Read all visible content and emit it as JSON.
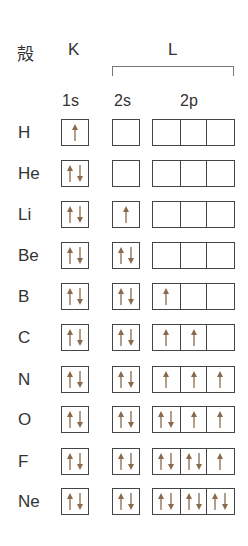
{
  "header": {
    "shell_label": "殻",
    "shell_k": "K",
    "shell_l": "L",
    "orbital_1s": "1s",
    "orbital_2s": "2s",
    "orbital_2p": "2p"
  },
  "colors": {
    "arrow": "#8a6a4a",
    "box_border": "#444444",
    "text": "#333333"
  },
  "rows": [
    {
      "element": "H",
      "s1": "u",
      "s2": "",
      "p": [
        "",
        "",
        ""
      ]
    },
    {
      "element": "He",
      "s1": "ud",
      "s2": "",
      "p": [
        "",
        "",
        ""
      ]
    },
    {
      "element": "Li",
      "s1": "ud",
      "s2": "u",
      "p": [
        "",
        "",
        ""
      ]
    },
    {
      "element": "Be",
      "s1": "ud",
      "s2": "ud",
      "p": [
        "",
        "",
        ""
      ]
    },
    {
      "element": "B",
      "s1": "ud",
      "s2": "ud",
      "p": [
        "u",
        "",
        ""
      ]
    },
    {
      "element": "C",
      "s1": "ud",
      "s2": "ud",
      "p": [
        "u",
        "u",
        ""
      ]
    },
    {
      "element": "N",
      "s1": "ud",
      "s2": "ud",
      "p": [
        "u",
        "u",
        "u"
      ]
    },
    {
      "element": "O",
      "s1": "ud",
      "s2": "ud",
      "p": [
        "ud",
        "u",
        "u"
      ]
    },
    {
      "element": "F",
      "s1": "ud",
      "s2": "ud",
      "p": [
        "ud",
        "ud",
        "u"
      ]
    },
    {
      "element": "Ne",
      "s1": "ud",
      "s2": "ud",
      "p": [
        "ud",
        "ud",
        "ud"
      ]
    }
  ]
}
